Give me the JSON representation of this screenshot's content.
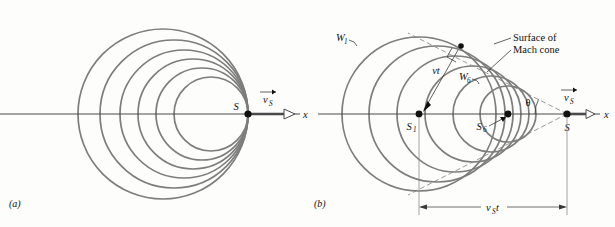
{
  "figure": {
    "background_color": "#fdfdfc",
    "wavefront_color": "#7d7d7d",
    "axis_color": "#4a4a4a",
    "dash_color": "#9a9a9a"
  },
  "panel_a": {
    "label": "(a)",
    "source_label": "S",
    "velocity_label": "v",
    "velocity_sub": "S",
    "axis_label": "x",
    "source_point": {
      "x": 248,
      "y": 114
    },
    "num_wavefronts": 6,
    "description": "Wavefronts all tangent at the source point; source speed equals wave speed",
    "wavefronts": [
      {
        "name": "W1",
        "center_x": 163,
        "center_y": 114,
        "radius": 85
      },
      {
        "name": "W2",
        "center_x": 174,
        "center_y": 114,
        "radius": 74
      },
      {
        "name": "W3",
        "center_x": 184,
        "center_y": 114,
        "radius": 64
      },
      {
        "name": "W4",
        "center_x": 193,
        "center_y": 114,
        "radius": 55
      },
      {
        "name": "W5",
        "center_x": 202,
        "center_y": 114,
        "radius": 46
      },
      {
        "name": "W6",
        "center_x": 211,
        "center_y": 114,
        "radius": 37
      }
    ]
  },
  "panel_b": {
    "label": "(b)",
    "source_label": "S",
    "source_first_label": "S",
    "source_first_sub": "1",
    "source_sixth_label": "S",
    "source_sixth_sub": "6",
    "wavefront_first_label": "W",
    "wavefront_first_sub": "1",
    "wavefront_sixth_label": "W",
    "wavefront_sixth_sub": "6",
    "mach_cone_label": "Surface of Mach cone",
    "mach_cone_line1": "Surface of",
    "mach_cone_line2": "Mach cone",
    "radius_label": "vt",
    "distance_label": "v",
    "distance_sub": "S",
    "distance_label_tail": "t",
    "angle_label": "θ",
    "velocity_label": "v",
    "velocity_sub": "S",
    "axis_label": "x",
    "source_point": {
      "x": 567,
      "y": 114
    },
    "s1_point": {
      "x": 419,
      "y": 114
    },
    "s6_point": {
      "x": 508,
      "y": 114
    },
    "tangent_point": {
      "x": 461,
      "y": 46
    },
    "num_wavefronts": 6,
    "mach_angle_degrees": 27,
    "description": "Source moves faster than wave speed; wavefronts bunch into a Mach cone with half-angle theta",
    "wavefronts": [
      {
        "name": "W1",
        "center_x": 419,
        "center_y": 114,
        "radius": 77
      },
      {
        "name": "W2",
        "center_x": 437,
        "center_y": 114,
        "radius": 68
      },
      {
        "name": "W3",
        "center_x": 455,
        "center_y": 114,
        "radius": 58
      },
      {
        "name": "W4",
        "center_x": 473,
        "center_y": 114,
        "radius": 48
      },
      {
        "name": "W5",
        "center_x": 491,
        "center_y": 114,
        "radius": 38
      },
      {
        "name": "W6",
        "center_x": 508,
        "center_y": 114,
        "radius": 28
      }
    ]
  }
}
